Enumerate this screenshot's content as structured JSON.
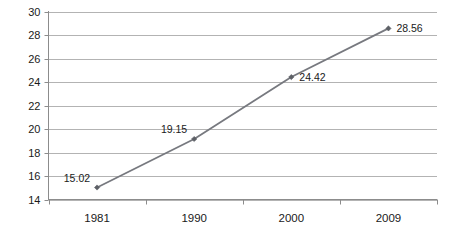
{
  "chart_data": {
    "type": "line",
    "title": "",
    "subtitle": "",
    "xlabel": "",
    "ylabel": "",
    "categories": [
      "1981",
      "1990",
      "2000",
      "2009"
    ],
    "values": [
      15.02,
      19.15,
      24.42,
      28.56
    ],
    "point_labels": [
      "15.02",
      "19.15",
      "24.42",
      "28.56"
    ],
    "series": [
      {
        "name": "",
        "values": [
          15.02,
          19.15,
          24.42,
          28.56
        ]
      }
    ],
    "ylim": [
      14,
      30
    ],
    "yticks": [
      14,
      16,
      18,
      20,
      22,
      24,
      26,
      28,
      30
    ],
    "ytick_labels": [
      "14",
      "16",
      "18",
      "20",
      "22",
      "24",
      "26",
      "28",
      "30"
    ],
    "grid": "horizontal",
    "legend": "none",
    "colors": {
      "line": "#77797f",
      "marker": "#5d6066",
      "gridline": "#b3b3b3",
      "axis": "#8c8c8c",
      "text": "#1a1a1a",
      "background": "#ffffff"
    },
    "label_positions": [
      "left-above",
      "left-above",
      "right",
      "right"
    ]
  }
}
